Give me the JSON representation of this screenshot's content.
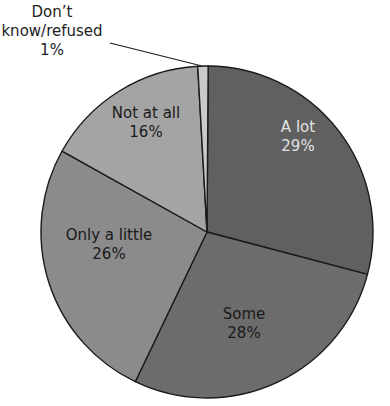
{
  "chart_data": {
    "type": "pie",
    "title": "",
    "categories": [
      "A lot",
      "Some",
      "Only a little",
      "Not at all",
      "Don't know/refused"
    ],
    "values": [
      29,
      28,
      26,
      16,
      1
    ],
    "unit": "%",
    "start_angle_deg": 0,
    "direction": "clockwise",
    "colors": [
      "#606060",
      "#6c6c6c",
      "#8b8b8b",
      "#a4a4a4",
      "#c9c9c9"
    ],
    "label_colors": [
      "#e2e2e2",
      "#1a1a1a",
      "#1a1a1a",
      "#1a1a1a",
      "#222222"
    ],
    "legend": "none",
    "labels_inside": true
  },
  "labels": {
    "a_lot": {
      "name": "A lot",
      "pct": "29%"
    },
    "some": {
      "name": "Some",
      "pct": "28%"
    },
    "only_a_little": {
      "name": "Only a little",
      "pct": "26%"
    },
    "not_at_all": {
      "name": "Not at all",
      "pct": "16%"
    },
    "dont_know": {
      "line1": "Don’t",
      "line2": "know/refused",
      "pct": "1%"
    }
  },
  "colors": {
    "outline": "#1a1a1a",
    "background": "#ffffff"
  }
}
